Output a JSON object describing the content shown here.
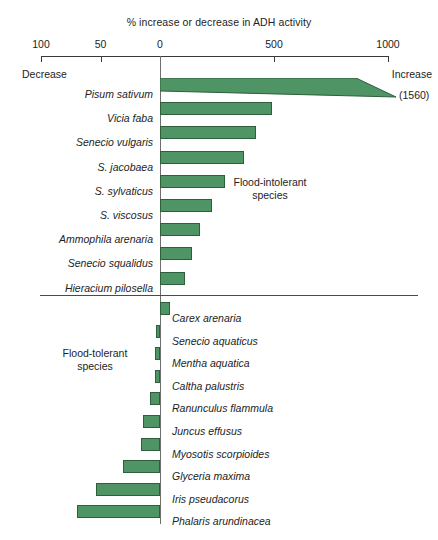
{
  "chart_data": {
    "type": "bar",
    "title": "% increase or decrease in ADH activity",
    "xlabel": "% increase or decrease in ADH activity",
    "ylabel": "",
    "orientation": "horizontal",
    "grid": false,
    "legend": "none",
    "axis": {
      "ticks": [
        "100",
        "50",
        "0",
        "500",
        "1000"
      ],
      "tick_values": [
        -100,
        -50,
        0,
        500,
        1000
      ],
      "note": "asymmetric scale: decrease side (0 to -100) is expanded relative to increase side (0 to 1000)",
      "left_end_caption": "Decrease",
      "right_end_caption": "Increase",
      "xlim": [
        -100,
        1000
      ]
    },
    "groups": [
      {
        "name": "Flood-intolerant species",
        "caption": "Flood-intolerant\nspecies",
        "caption_line1": "Flood-intolerant",
        "caption_line2": "species",
        "categories": [
          "Pisum sativum",
          "Vicia faba",
          "Senecio vulgaris",
          "S. jacobaea",
          "S. sylvaticus",
          "S. viscosus",
          "Ammophila arenaria",
          "Senecio squalidus",
          "Hieracium pilosella"
        ],
        "values": [
          1560,
          490,
          420,
          370,
          285,
          230,
          175,
          140,
          110
        ],
        "annotations": [
          {
            "category": "Pisum sativum",
            "text": "(1560)",
            "broken_bar": true
          }
        ]
      },
      {
        "name": "Flood-tolerant species",
        "caption": "Flood-tolerant\nspecies",
        "caption_line1": "Flood-tolerant",
        "caption_line2": "species",
        "categories": [
          "Carex arenaria",
          "Senecio aquaticus",
          "Mentha aquatica",
          "Caltha palustris",
          "Ranunculus flammula",
          "Juncus effusus",
          "Myosotis scorpioides",
          "Glyceria maxima",
          "Iris pseudacorus",
          "Phalaris arundinacea"
        ],
        "values": [
          45,
          -3,
          -4,
          -4,
          -8,
          -14,
          -16,
          -31,
          -54,
          -70
        ],
        "annotations": []
      }
    ],
    "colors": {
      "bar_fill": "#4f9464",
      "bar_stroke": "#2f5e3c",
      "axis": "#3a3a3a",
      "text": "#1d1d1d"
    }
  }
}
